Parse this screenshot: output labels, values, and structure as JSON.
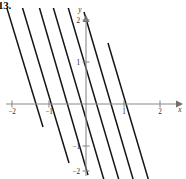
{
  "figure": {
    "problem_number": "13.",
    "caption": "Family of parallel straight lines with negative slope on xy-axes"
  },
  "axes": {
    "x_axis_label": "x",
    "y_axis_label": "y",
    "x_ticks": [
      {
        "value": -2,
        "label": "−2",
        "px": 12
      },
      {
        "value": -1,
        "label": "−1",
        "px": 49
      },
      {
        "value": 1,
        "label": "1",
        "px": 124
      },
      {
        "value": 2,
        "label": "2",
        "px": 160
      }
    ],
    "y_ticks": [
      {
        "value": 2,
        "label": "2",
        "px": 20
      },
      {
        "value": 1,
        "label": "1",
        "px": 62
      },
      {
        "value": -1,
        "label": "−1",
        "px": 146
      },
      {
        "value": -2,
        "label": "−2",
        "px": 171
      }
    ],
    "origin_px": {
      "x": 86,
      "y": 104
    },
    "x_unit_px": 37,
    "y_unit_px": 42,
    "x_range": [
      -2.35,
      2.5
    ],
    "y_range": [
      -2.3,
      2.2
    ],
    "grid": false
  },
  "colors": {
    "curve": "#141414",
    "axis": "#8a8a8a",
    "label": "#2b2b2b",
    "background": "#ffffff"
  },
  "chart_data": {
    "type": "line",
    "title": "",
    "subtitle": "",
    "xlabel": "x",
    "ylabel": "y",
    "xlim": [
      -2.35,
      2.5
    ],
    "ylim": [
      -2.3,
      2.2
    ],
    "grid": false,
    "legend": "none",
    "annotations": [],
    "slope": -3,
    "series": [
      {
        "name": "line-1",
        "intercept_c": -4.0,
        "points": [
          {
            "x": -2.3,
            "y": 2.9
          },
          {
            "x": -1.15,
            "y": -0.55
          }
        ],
        "px": {
          "x1": -1,
          "y1": -18,
          "x2": 43,
          "y2": 127
        }
      },
      {
        "name": "line-2",
        "intercept_c": -2.75,
        "points": [
          {
            "x": -2.33,
            "y": 4.24
          },
          {
            "x": -0.45,
            "y": -1.4
          }
        ],
        "px": {
          "x1": -2,
          "y1": -74,
          "x2": 69,
          "y2": 163
        }
      },
      {
        "name": "line-3",
        "intercept_c": -1.5,
        "points": [
          {
            "x": -1.85,
            "y": 4.05
          },
          {
            "x": 0.06,
            "y": -1.68
          }
        ],
        "px": {
          "x1": 18,
          "y1": -66,
          "x2": 88,
          "y2": 175
        }
      },
      {
        "name": "line-4",
        "intercept_c": -0.35,
        "points": [
          {
            "x": -1.0,
            "y": 2.65
          },
          {
            "x": 0.75,
            "y": -2.6
          }
        ],
        "px": {
          "x1": 49,
          "y1": -7,
          "x2": 114,
          "y2": 214
        }
      },
      {
        "name": "line-5",
        "intercept_c": 0.85,
        "points": [
          {
            "x": -0.62,
            "y": 2.71
          },
          {
            "x": 1.35,
            "y": -3.2
          }
        ],
        "px": {
          "x1": 63,
          "y1": -10,
          "x2": 136,
          "y2": 238
        }
      },
      {
        "name": "line-6",
        "intercept_c": 2.05,
        "points": [
          {
            "x": -0.05,
            "y": 2.2
          },
          {
            "x": 1.95,
            "y": -3.8
          }
        ],
        "px": {
          "x1": 84,
          "y1": 12,
          "x2": 158,
          "y2": 264
        }
      },
      {
        "name": "line-7",
        "intercept_c": 3.25,
        "points": [
          {
            "x": 0.6,
            "y": 1.45
          },
          {
            "x": 2.5,
            "y": -4.25
          }
        ],
        "px": {
          "x1": 108,
          "y1": 43,
          "x2": 179,
          "y2": 283
        }
      }
    ]
  }
}
